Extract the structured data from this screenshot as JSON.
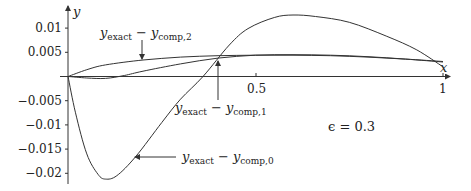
{
  "chart_data": {
    "type": "line",
    "title": "",
    "xlabel": "x",
    "ylabel": "y",
    "xlim": [
      0,
      1.02
    ],
    "ylim": [
      -0.022,
      0.013
    ],
    "grid": false,
    "legend": "none (annotated labels with arrows)",
    "x_ticks": [
      {
        "value": 0.5,
        "label": "0.5"
      },
      {
        "value": 1,
        "label": "1"
      }
    ],
    "y_ticks": [
      {
        "value": 0.01,
        "label": "0.01"
      },
      {
        "value": 0.005,
        "label": "0.005"
      },
      {
        "value": -0.005,
        "label": "−0.005"
      },
      {
        "value": -0.01,
        "label": "−0.01"
      },
      {
        "value": -0.015,
        "label": "−0.015"
      },
      {
        "value": -0.02,
        "label": "−0.02"
      }
    ],
    "series": [
      {
        "name": "y_exact - y_comp,0",
        "label_main": "y",
        "label_sub1": "exact",
        "label_mid": " − y",
        "label_sub2": "comp,0",
        "x": [
          0,
          0.02,
          0.05,
          0.08,
          0.1,
          0.13,
          0.18,
          0.25,
          0.3,
          0.36,
          0.43,
          0.48,
          0.55,
          0.6,
          0.66,
          0.75,
          0.85,
          0.93,
          1.0
        ],
        "y": [
          0,
          -0.0075,
          -0.016,
          -0.0202,
          -0.0212,
          -0.0205,
          -0.0166,
          -0.0095,
          -0.0047,
          0,
          0.0065,
          0.0099,
          0.0122,
          0.0127,
          0.0124,
          0.0112,
          0.0083,
          0.0055,
          0.002
        ]
      },
      {
        "name": "y_exact - y_comp,1",
        "label_main": "y",
        "label_sub1": "exact",
        "label_mid": " − y",
        "label_sub2": "comp,1",
        "x": [
          0,
          0.05,
          0.1,
          0.15,
          0.2,
          0.3,
          0.4,
          0.5,
          0.6,
          0.7,
          0.8,
          0.9,
          1.0
        ],
        "y": [
          0,
          -0.0003,
          -0.0004,
          0.0002,
          0.0011,
          0.0026,
          0.0038,
          0.0044,
          0.0045,
          0.0044,
          0.0041,
          0.0036,
          0.003
        ]
      },
      {
        "name": "y_exact - y_comp,2",
        "label_main": "y",
        "label_sub1": "exact",
        "label_mid": " − y",
        "label_sub2": "comp,2",
        "x": [
          0,
          0.05,
          0.1,
          0.2,
          0.3,
          0.4,
          0.5,
          0.6,
          0.7,
          0.8,
          0.9,
          1.0
        ],
        "y": [
          0,
          0.0014,
          0.0024,
          0.0034,
          0.004,
          0.0043,
          0.0044,
          0.0044,
          0.0043,
          0.004,
          0.0036,
          0.0031
        ]
      }
    ],
    "annotations": [
      {
        "text": "ϵ = 0.3",
        "x": 0.7,
        "y": -0.011
      }
    ]
  },
  "labels": {
    "x_axis": "x",
    "y_axis": "y",
    "epsilon": "ϵ = 0.3",
    "tick_0_5": "0.5",
    "tick_1": "1",
    "ytick_0": "0.01",
    "ytick_1": "0.005",
    "ytick_2": "−0.005",
    "ytick_3": "−0.01",
    "ytick_4": "−0.015",
    "ytick_5": "−0.02",
    "curve0_main": "y",
    "curve0_sub1": "exact",
    "curve0_mid": " − y",
    "curve0_sub2": "comp,0",
    "curve1_main": "y",
    "curve1_sub1": "exact",
    "curve1_mid": " − y",
    "curve1_sub2": "comp,1",
    "curve2_main": "y",
    "curve2_sub1": "exact",
    "curve2_mid": " − y",
    "curve2_sub2": "comp,2"
  }
}
